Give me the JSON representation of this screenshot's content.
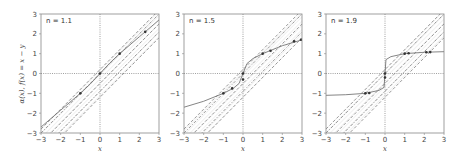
{
  "figure": {
    "ylabel": "α(x), f(x) = x − y",
    "xlabel": "x"
  },
  "chart_data": [
    {
      "type": "line",
      "title": "n = 1.1",
      "annotation": "n = 1.1",
      "n": 1.1,
      "xlabel": "x",
      "ylabel": "α(x), f(x) = x − y",
      "xlim": [
        -3,
        3
      ],
      "ylim": [
        -3,
        3
      ],
      "xticks": [
        -3,
        -2,
        -1,
        0,
        1,
        2,
        3
      ],
      "yticks": [
        -3,
        -2,
        -1,
        0,
        1,
        2,
        3
      ],
      "grid": false,
      "reference_lines": {
        "x_zero": "dotted",
        "y_zero": "dotted",
        "diagonals": [
          {
            "eq": "y = x + 0.2",
            "style": "dashed"
          },
          {
            "eq": "y = x",
            "style": "dash-dot"
          },
          {
            "eq": "y = x - 0.5",
            "style": "dashed"
          },
          {
            "eq": "y = x - 0.9",
            "style": "dash-dot"
          },
          {
            "eq": "y = x - 1.2",
            "style": "dashed"
          }
        ],
        "hatched_band": "between y = x + 0.2 and y = x - 1.2"
      },
      "series": [
        {
          "name": "α(x)",
          "style": "solid",
          "x": [
            -3,
            -2,
            -1,
            -0.5,
            0,
            0.5,
            1,
            2,
            3
          ],
          "y": [
            -2.7,
            -1.85,
            -1.0,
            -0.53,
            0,
            0.53,
            1.0,
            1.85,
            2.7
          ]
        }
      ],
      "markers": [
        {
          "x": -1,
          "y": -1
        },
        {
          "x": 0,
          "y": 0
        },
        {
          "x": 1,
          "y": 1
        },
        {
          "x": 2.3,
          "y": 2.1
        }
      ]
    },
    {
      "type": "line",
      "title": "n = 1.5",
      "annotation": "n = 1.5",
      "n": 1.5,
      "xlabel": "x",
      "xlim": [
        -3,
        3
      ],
      "ylim": [
        -3,
        3
      ],
      "xticks": [
        -3,
        -2,
        -1,
        0,
        1,
        2,
        3
      ],
      "yticks": [
        -3,
        -2,
        -1,
        0,
        1,
        2,
        3
      ],
      "grid": false,
      "reference_lines": {
        "x_zero": "dotted",
        "y_zero": "dotted",
        "diagonals": [
          {
            "eq": "y = x + 0.2",
            "style": "dashed"
          },
          {
            "eq": "y = x",
            "style": "dash-dot"
          },
          {
            "eq": "y = x - 0.5",
            "style": "dashed"
          },
          {
            "eq": "y = x - 0.9",
            "style": "dash-dot"
          },
          {
            "eq": "y = x - 1.2",
            "style": "dashed"
          }
        ],
        "hatched_band": "between y = x + 0.2 and y = x - 1.2"
      },
      "series": [
        {
          "name": "α(x)",
          "style": "solid",
          "x": [
            -3,
            -2,
            -1,
            -0.5,
            -0.2,
            0,
            0.2,
            0.5,
            1,
            2,
            3
          ],
          "y": [
            -1.7,
            -1.4,
            -1.0,
            -0.75,
            -0.5,
            0,
            0.5,
            0.75,
            1.0,
            1.4,
            1.7
          ]
        }
      ],
      "markers": [
        {
          "x": -1,
          "y": -1
        },
        {
          "x": -0.55,
          "y": -0.75
        },
        {
          "x": 0,
          "y": 0
        },
        {
          "x": 0,
          "y": -0.3
        },
        {
          "x": 1,
          "y": 1
        },
        {
          "x": 1.4,
          "y": 1.15
        },
        {
          "x": 2.6,
          "y": 1.62
        },
        {
          "x": 2.95,
          "y": 1.7
        }
      ]
    },
    {
      "type": "line",
      "title": "n = 1.9",
      "annotation": "n = 1.9",
      "n": 1.9,
      "xlabel": "x",
      "xlim": [
        -3,
        3
      ],
      "ylim": [
        -3,
        3
      ],
      "xticks": [
        -3,
        -2,
        -1,
        0,
        1,
        2,
        3
      ],
      "yticks": [
        -3,
        -2,
        -1,
        0,
        1,
        2,
        3
      ],
      "grid": false,
      "reference_lines": {
        "x_zero": "dotted",
        "y_zero": "dotted",
        "diagonals": [
          {
            "eq": "y = x + 0.2",
            "style": "dashed"
          },
          {
            "eq": "y = x",
            "style": "dash-dot"
          },
          {
            "eq": "y = x - 0.5",
            "style": "dashed"
          },
          {
            "eq": "y = x - 0.9",
            "style": "dash-dot"
          },
          {
            "eq": "y = x - 1.2",
            "style": "dashed"
          }
        ],
        "hatched_band": "between y = x + 0.2 and y = x - 1.2"
      },
      "series": [
        {
          "name": "α(x)",
          "style": "solid",
          "x": [
            -3,
            -2,
            -1,
            -0.3,
            -0.05,
            0,
            0.05,
            0.3,
            1,
            2,
            3
          ],
          "y": [
            -1.1,
            -1.07,
            -1.0,
            -0.85,
            -0.7,
            0,
            0.7,
            0.85,
            1.0,
            1.07,
            1.1
          ]
        }
      ],
      "markers": [
        {
          "x": -1,
          "y": -1
        },
        {
          "x": -0.8,
          "y": -0.98
        },
        {
          "x": 0,
          "y": 0
        },
        {
          "x": 0,
          "y": -0.2
        },
        {
          "x": 1,
          "y": 1
        },
        {
          "x": 1.2,
          "y": 1.02
        },
        {
          "x": 2.1,
          "y": 1.07
        },
        {
          "x": 2.3,
          "y": 1.08
        }
      ]
    }
  ]
}
